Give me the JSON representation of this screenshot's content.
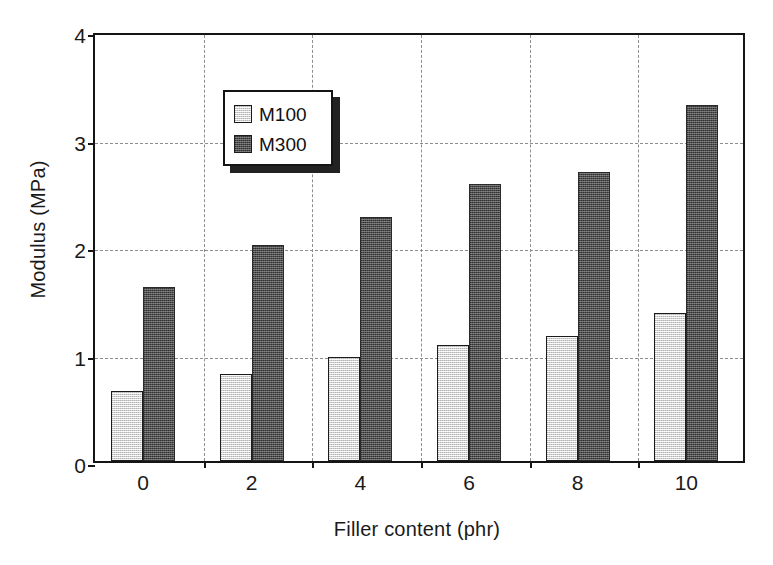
{
  "chart_data": {
    "type": "bar",
    "title": "",
    "xlabel": "Filler content (phr)",
    "ylabel": "Modulus (MPa)",
    "categories": [
      "0",
      "2",
      "4",
      "6",
      "8",
      "10"
    ],
    "series": [
      {
        "name": "M100",
        "values": [
          0.65,
          0.81,
          0.97,
          1.08,
          1.16,
          1.38
        ]
      },
      {
        "name": "M300",
        "values": [
          1.62,
          2.01,
          2.27,
          2.58,
          2.69,
          3.31
        ]
      }
    ],
    "ylim": [
      0,
      4
    ],
    "yticks": [
      0,
      1,
      2,
      3,
      4
    ],
    "ytick_labels": [
      "0",
      "1",
      "2",
      "3",
      "4"
    ],
    "grid": "dashed horizontal and vertical",
    "legend_position": "upper left inside axes",
    "colors": {
      "m100": "#d2d2d2",
      "m300": "#4d4d4d",
      "axis": "#151515",
      "grid": "#8e8e8e",
      "background": "#ffffff"
    }
  }
}
